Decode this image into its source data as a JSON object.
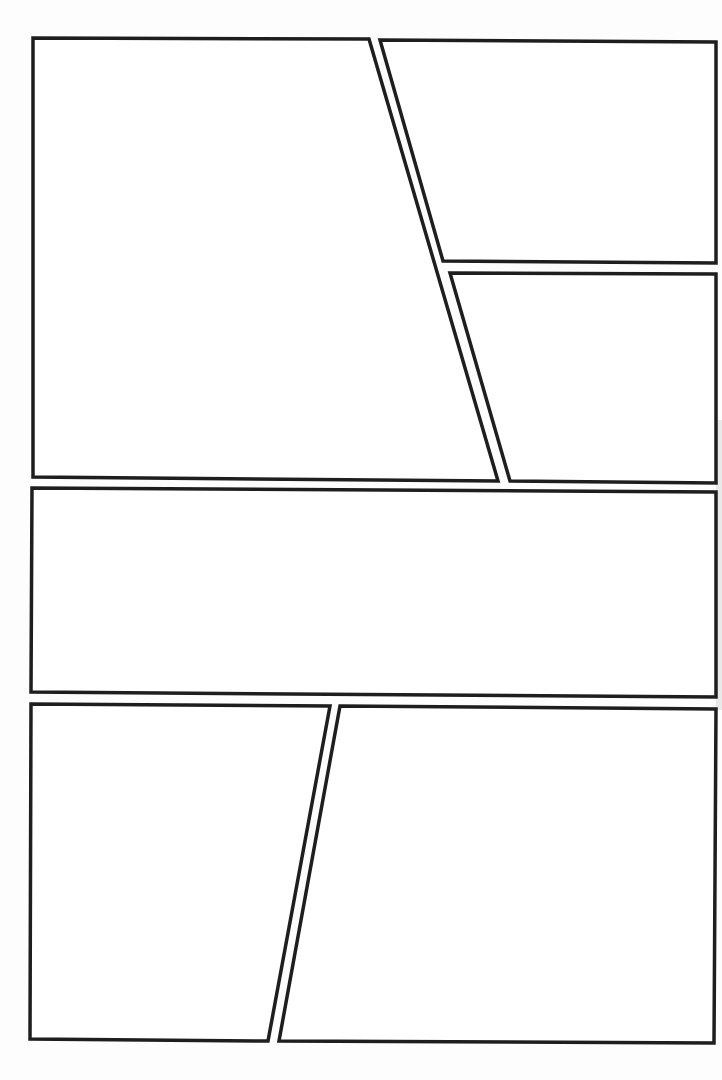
{
  "page": {
    "type": "comic-panel-template",
    "width": 722,
    "height": 1080,
    "background": "#fdfdfd",
    "border_color": "#1e1e1e",
    "border_width": 3.5
  },
  "rows": [
    {
      "name": "top-row",
      "panels": [
        {
          "id": "panel-1",
          "points": "33,38 369,39 498,481 33,477"
        },
        {
          "id": "panel-2",
          "points": "380,40 716,42 716,263 443,261"
        },
        {
          "id": "panel-3",
          "points": "450,273 716,274 716,483 510,481"
        }
      ]
    },
    {
      "name": "middle-row",
      "panels": [
        {
          "id": "panel-4",
          "points": "32,488 716,492 716,697 31,692"
        }
      ]
    },
    {
      "name": "bottom-row",
      "panels": [
        {
          "id": "panel-5",
          "points": "31,704 330,706 268,1041 30,1039"
        },
        {
          "id": "panel-6",
          "points": "340,706 716,709 714,1043 279,1041"
        }
      ]
    }
  ]
}
